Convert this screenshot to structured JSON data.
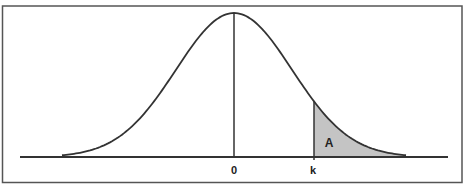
{
  "diagram": {
    "type": "normal-distribution-curve",
    "labels": {
      "mean": "0",
      "cutoff": "k",
      "area": "A"
    },
    "shaded_region": "right tail beyond k",
    "colors": {
      "line": "#333333",
      "frame": "#555555",
      "fill": "#c4c4c4",
      "background": "#ffffff"
    }
  }
}
